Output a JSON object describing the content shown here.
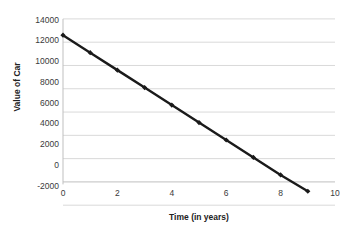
{
  "chart_data": {
    "type": "line",
    "title": "",
    "xlabel": "Time (in years)",
    "ylabel": "Value of Car",
    "x": [
      0,
      1,
      2,
      3,
      4,
      5,
      6,
      7,
      8,
      9
    ],
    "values": [
      12600,
      11100,
      9600,
      8100,
      6600,
      5100,
      3600,
      2100,
      600,
      -800
    ],
    "series": [
      {
        "name": "Value of Car",
        "values": [
          12600,
          11100,
          9600,
          8100,
          6600,
          5100,
          3600,
          2100,
          600,
          -800
        ]
      }
    ],
    "xlim": [
      0,
      10
    ],
    "ylim": [
      -2000,
      14000
    ],
    "x_ticks": [
      0,
      2,
      4,
      6,
      8,
      10
    ],
    "x_tick_labels": [
      "0",
      "2",
      "4",
      "6",
      "8",
      "10"
    ],
    "y_ticks": [
      -2000,
      0,
      2000,
      4000,
      6000,
      8000,
      10000,
      12000,
      14000
    ],
    "y_tick_labels": [
      "-2000",
      "0",
      "2000",
      "4000",
      "6000",
      "8000",
      "10000",
      "12000",
      "14000"
    ],
    "grid": "horizontal",
    "legend": "none",
    "marker": "diamond",
    "line_color": "#1a1a1a",
    "marker_color": "#1a1a1a",
    "grid_color": "#d9d9d9",
    "axis_color": "#bfbfbf",
    "background_color": "#ffffff"
  }
}
